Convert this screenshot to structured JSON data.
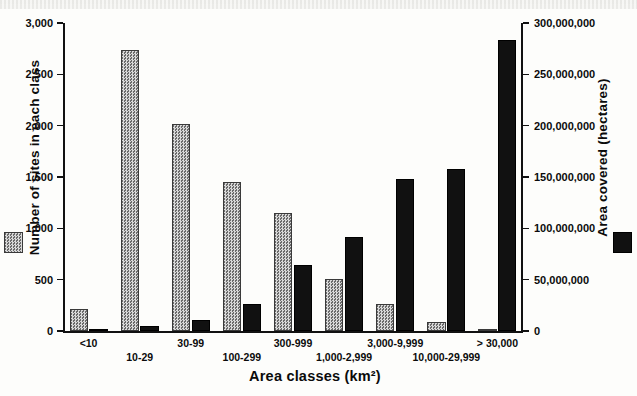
{
  "chart_data": {
    "type": "bar",
    "title": "",
    "xlabel": "Area classes (km²)",
    "categories": [
      "<10",
      "10-29",
      "30-99",
      "100-299",
      "300-999",
      "1,000-2,999",
      "3,000-9,999",
      "10,000-29,999",
      "> 30,000"
    ],
    "series": [
      {
        "name": "Number of sites in each class",
        "axis": "left",
        "color": "#a9a9a9",
        "pattern": "checkered-gray",
        "values": [
          215,
          2740,
          2015,
          1450,
          1150,
          510,
          265,
          90,
          20
        ]
      },
      {
        "name": "Area covered (hectares)",
        "axis": "right",
        "color": "#111111",
        "pattern": "solid-black",
        "values": [
          500000,
          4500000,
          11000000,
          26000000,
          64000000,
          92000000,
          148000000,
          158000000,
          283000000
        ]
      }
    ],
    "left_axis": {
      "label": "Number of sites in each class",
      "ticks": [
        "0",
        "500",
        "1,000",
        "1,500",
        "2,000",
        "2,500",
        "3,000"
      ],
      "tick_values": [
        0,
        500,
        1000,
        1500,
        2000,
        2500,
        3000
      ],
      "ylim": [
        0,
        3000
      ]
    },
    "right_axis": {
      "label": "Area covered (hectares)",
      "ticks": [
        "0",
        "50,000,000",
        "100,000,000",
        "150,000,000",
        "200,000,000",
        "250,000,000",
        "300,000,000"
      ],
      "tick_values": [
        0,
        50000000,
        100000000,
        150000000,
        200000000,
        250000000,
        300000000
      ],
      "ylim": [
        0,
        300000000
      ]
    },
    "grid": false,
    "legend_position": "outside-left-and-right"
  },
  "legend": {
    "sites_swatch": "checkered-gray-swatch",
    "area_swatch": "solid-black-swatch"
  }
}
